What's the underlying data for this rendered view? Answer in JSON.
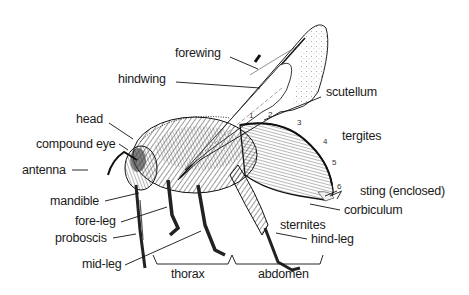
{
  "diagram": {
    "labels": {
      "forewing": "forewing",
      "hindwing": "hindwing",
      "scutellum": "scutellum",
      "head": "head",
      "compound_eye": "compound eye",
      "tergites": "tergites",
      "antenna": "antenna",
      "mandible": "mandible",
      "sting": "sting (enclosed)",
      "fore_leg": "fore-leg",
      "corbiculum": "corbiculum",
      "sternites": "sternites",
      "proboscis": "proboscis",
      "hind_leg": "hind-leg",
      "mid_leg": "mid-leg",
      "thorax": "thorax",
      "abdomen": "abdomen"
    },
    "segment_numbers": [
      "1",
      "2",
      "3",
      "4",
      "5",
      "6"
    ],
    "colors": {
      "ink": "#1a1a1a",
      "background": "#ffffff"
    }
  }
}
